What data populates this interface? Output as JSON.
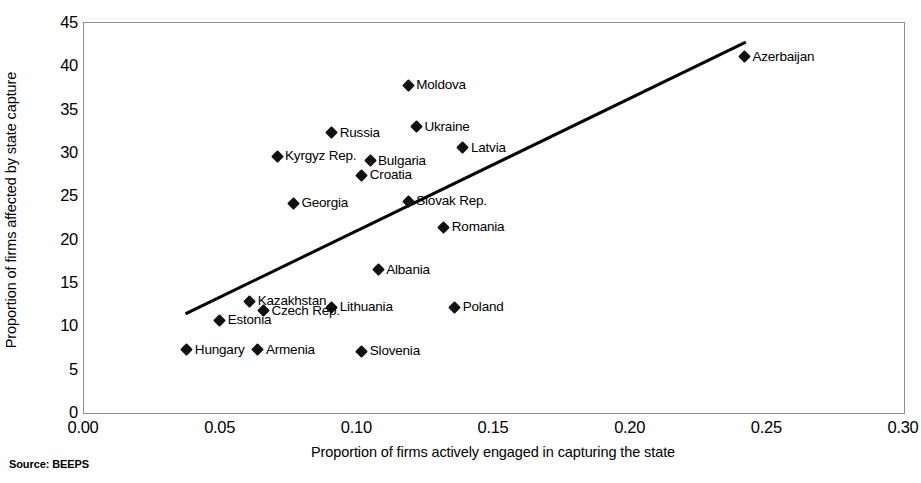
{
  "chart_data": {
    "type": "scatter",
    "title": "",
    "xlabel": "Proportion of firms actively engaged in capturing the state",
    "ylabel": "Proportion of firms affected by state capture",
    "xlim": [
      0.0,
      0.3
    ],
    "ylim": [
      0,
      45
    ],
    "xticks": [
      "0.00",
      "0.05",
      "0.10",
      "0.15",
      "0.20",
      "0.25",
      "0.30"
    ],
    "xtick_values": [
      0.0,
      0.05,
      0.1,
      0.15,
      0.2,
      0.25,
      0.3
    ],
    "yticks": [
      "0",
      "5",
      "10",
      "15",
      "20",
      "25",
      "30",
      "35",
      "40",
      "45"
    ],
    "ytick_values": [
      0,
      5,
      10,
      15,
      20,
      25,
      30,
      35,
      40,
      45
    ],
    "grid": false,
    "legend": "none",
    "source": "Source: BEEPS",
    "marker_color": "#111111",
    "trendline": {
      "type": "linear",
      "color": "#000000",
      "x_start": 0.038,
      "y_start": 11.4,
      "x_end": 0.242,
      "y_end": 42.6
    },
    "points": [
      {
        "label": "Azerbaijan",
        "x": 0.242,
        "y": 41.0,
        "label_side": "right"
      },
      {
        "label": "Moldova",
        "x": 0.119,
        "y": 37.7,
        "label_side": "right"
      },
      {
        "label": "Ukraine",
        "x": 0.122,
        "y": 32.9,
        "label_side": "right"
      },
      {
        "label": "Russia",
        "x": 0.091,
        "y": 32.2,
        "label_side": "right"
      },
      {
        "label": "Latvia",
        "x": 0.139,
        "y": 30.5,
        "label_side": "right"
      },
      {
        "label": "Kyrgyz Rep.",
        "x": 0.071,
        "y": 29.5,
        "label_side": "right"
      },
      {
        "label": "Bulgaria",
        "x": 0.105,
        "y": 29.0,
        "label_side": "right"
      },
      {
        "label": "Croatia",
        "x": 0.102,
        "y": 27.3,
        "label_side": "right"
      },
      {
        "label": "Slovak Rep.",
        "x": 0.119,
        "y": 24.3,
        "label_side": "right"
      },
      {
        "label": "Georgia",
        "x": 0.077,
        "y": 24.1,
        "label_side": "right"
      },
      {
        "label": "Romania",
        "x": 0.132,
        "y": 21.3,
        "label_side": "right"
      },
      {
        "label": "Albania",
        "x": 0.108,
        "y": 16.4,
        "label_side": "right"
      },
      {
        "label": "Kazakhstan",
        "x": 0.061,
        "y": 12.8,
        "label_side": "right"
      },
      {
        "label": "Lithuania",
        "x": 0.091,
        "y": 12.1,
        "label_side": "right"
      },
      {
        "label": "Poland",
        "x": 0.136,
        "y": 12.1,
        "label_side": "right"
      },
      {
        "label": "Czech Rep.",
        "x": 0.066,
        "y": 11.7,
        "label_side": "right"
      },
      {
        "label": "Estonia",
        "x": 0.05,
        "y": 10.6,
        "label_side": "right"
      },
      {
        "label": "Hungary",
        "x": 0.038,
        "y": 7.2,
        "label_side": "right"
      },
      {
        "label": "Armenia",
        "x": 0.064,
        "y": 7.2,
        "label_side": "right"
      },
      {
        "label": "Slovenia",
        "x": 0.102,
        "y": 7.0,
        "label_side": "right"
      }
    ]
  }
}
